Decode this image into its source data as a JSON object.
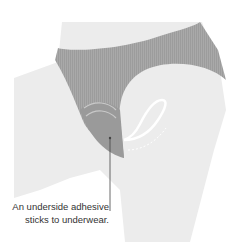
{
  "diagram": {
    "colors": {
      "skin": "#ececec",
      "fabric": "#a9a9a9",
      "fabric_stripe": "#9c9c9c",
      "outline": "#ffffff",
      "leader_line": "#444444",
      "text": "#333333"
    },
    "caption": {
      "line1": "An underside adhesive",
      "line2": "sticks to underwear."
    }
  }
}
